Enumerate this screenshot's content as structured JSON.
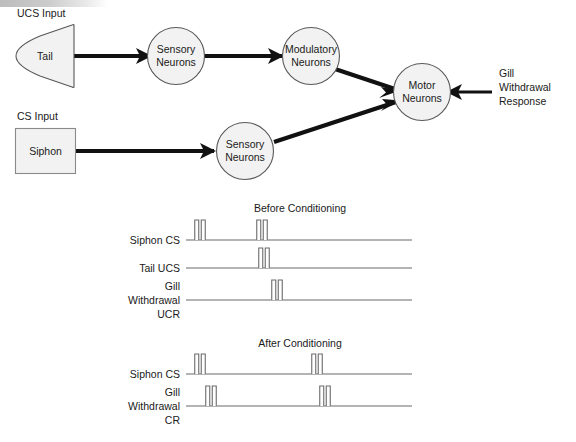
{
  "diagram": {
    "nodes": {
      "tail": {
        "label": "Tail",
        "input_label": "UCS Input"
      },
      "siphon": {
        "label": "Siphon",
        "input_label": "CS Input"
      },
      "sensory_ucs": {
        "line1": "Sensory",
        "line2": "Neurons"
      },
      "modulatory": {
        "line1": "Modulatory",
        "line2": "Neurons"
      },
      "sensory_cs": {
        "line1": "Sensory",
        "line2": "Neurons"
      },
      "motor": {
        "line1": "Motor",
        "line2": "Neurons"
      }
    },
    "output": {
      "line1": "Gill",
      "line2": "Withdrawal",
      "line3": "Response"
    },
    "colors": {
      "node_fill": "#f2f2f2",
      "node_stroke": "#58585a",
      "connector": "#111111",
      "timeline": "#6b6b6b",
      "text": "#1a1a1a"
    }
  },
  "charts": {
    "before": {
      "title": "Before Conditioning",
      "rows": [
        {
          "label_lines": [
            "Siphon CS"
          ],
          "baseline_y": 240,
          "pulses": [
            200,
            262
          ]
        },
        {
          "label_lines": [
            "Tail UCS"
          ],
          "baseline_y": 268,
          "pulses": [
            264
          ]
        },
        {
          "label_lines": [
            "Gill",
            "Withdrawal",
            "UCR"
          ],
          "baseline_y": 300,
          "pulses": [
            277
          ]
        }
      ]
    },
    "after": {
      "title": "After Conditioning",
      "rows": [
        {
          "label_lines": [
            "Siphon CS"
          ],
          "baseline_y": 374,
          "pulses": [
            200,
            317
          ]
        },
        {
          "label_lines": [
            "Gill",
            "Withdrawal",
            "CR"
          ],
          "baseline_y": 406,
          "pulses": [
            211,
            325
          ]
        }
      ]
    },
    "timeline_start_x": 186,
    "timeline_end_x": 412,
    "pulse_height": 20,
    "pulse_bar_width": 4,
    "pulse_gap": 2.5
  },
  "chart_data": {
    "type": "line",
    "xlabel": "Time",
    "ylabel": "Stimulus / Response",
    "grid": false,
    "legend": "none",
    "panels": [
      {
        "title": "Before Conditioning",
        "series": [
          {
            "name": "Siphon CS",
            "event_times": [
              200,
              262
            ],
            "values": [
              1,
              1
            ]
          },
          {
            "name": "Tail UCS",
            "event_times": [
              264
            ],
            "values": [
              1
            ]
          },
          {
            "name": "Gill Withdrawal UCR",
            "event_times": [
              277
            ],
            "values": [
              1
            ]
          }
        ]
      },
      {
        "title": "After Conditioning",
        "series": [
          {
            "name": "Siphon CS",
            "event_times": [
              200,
              317
            ],
            "values": [
              1,
              1
            ]
          },
          {
            "name": "Gill Withdrawal CR",
            "event_times": [
              211,
              325
            ],
            "values": [
              1,
              1
            ]
          }
        ]
      }
    ]
  }
}
